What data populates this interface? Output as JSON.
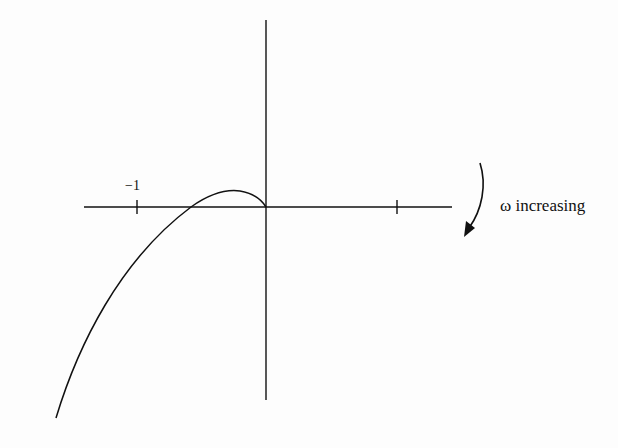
{
  "diagram": {
    "type": "nyquist-plot-sketch",
    "axes": {
      "x_axis": {
        "tick_labels": [
          "−1"
        ],
        "ticks_at": [
          -1,
          1
        ]
      },
      "y_axis": {
        "ticks_at": []
      }
    },
    "curve": {
      "description": "Nyquist locus approaching origin from third quadrant, crossing negative real axis between -1 and 0, with small excursion into upper half-plane before terminating at origin",
      "real_axis_crossing": -0.57,
      "peak_point": [
        -0.22,
        0.12
      ]
    },
    "annotation": {
      "label": "ω increasing",
      "icon": "curved-arrow-down-icon"
    }
  },
  "colors": {
    "line": "#111111",
    "background": "#fdfdfd"
  }
}
